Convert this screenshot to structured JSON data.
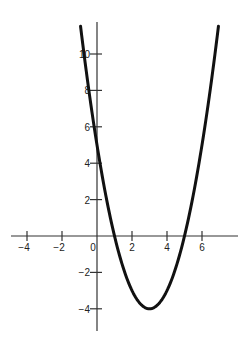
{
  "chart_data": {
    "type": "line",
    "title": "",
    "xlabel": "",
    "ylabel": "",
    "function": "y = x^2 - 6x + 5",
    "series": [
      {
        "name": "parabola",
        "x": [
          -0.94,
          -0.5,
          0,
          0.5,
          1,
          1.5,
          2,
          2.5,
          3,
          3.5,
          4,
          4.5,
          5,
          5.5,
          6,
          6.5,
          6.94
        ],
        "values": [
          11.52,
          8.25,
          5,
          2.25,
          0,
          -1.75,
          -3,
          -3.75,
          -4,
          -3.75,
          -3,
          -1.75,
          0,
          2.25,
          5,
          8.25,
          11.52
        ]
      }
    ],
    "key_points": {
      "x_intercepts": [
        1,
        5
      ],
      "y_intercept": 5,
      "vertex": [
        3,
        -4
      ]
    },
    "x_ticks": [
      -4,
      -2,
      0,
      2,
      4,
      6
    ],
    "x_tick_labels": [
      "−4",
      "−2",
      "0",
      "2",
      "4",
      "6"
    ],
    "y_ticks": [
      -4,
      -2,
      2,
      4,
      6,
      8,
      10
    ],
    "y_tick_labels": [
      "−4",
      "−2",
      "2",
      "4",
      "6",
      "8",
      "10"
    ],
    "xlim": [
      -5,
      8
    ],
    "ylim": [
      -5.2,
      11.8
    ],
    "grid": false,
    "legend": "none",
    "colors": {
      "curve": "#111111",
      "axes": "#333333"
    }
  }
}
